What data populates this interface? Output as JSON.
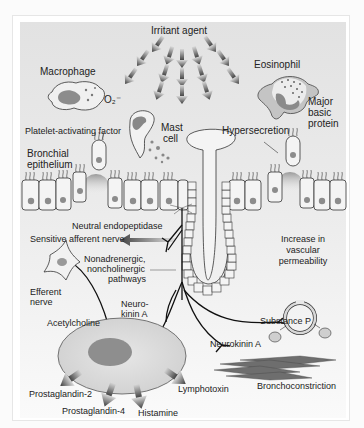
{
  "labels": {
    "irritant_agent": "Irritant agent",
    "macrophage": "Macrophage",
    "o2": "O₂⁻",
    "eosinophil": "Eosinophil",
    "major_basic_protein": "Major basic protein",
    "platelet_activating_factor": "Platelet-activating factor",
    "mast_cell_1": "Mast",
    "mast_cell_2": "cell",
    "hypersecretion": "Hypersecretion",
    "bronchial_epithelium_1": "Bronchial",
    "bronchial_epithelium_2": "epithelium",
    "neutral_endopeptidase": "Neutral endopeptidase",
    "sensitive_afferent_nerve": "Sensitive afferent nerve",
    "nanc_1": "Nonadrenergic,",
    "nanc_2": "noncholinergic",
    "nanc_3": "pathways",
    "vascular_1": "Increase in",
    "vascular_2": "vascular",
    "vascular_3": "permeability",
    "efferent_1": "Efferent",
    "efferent_2": "nerve",
    "neurokinin_a_split_1": "Neuro-",
    "neurokinin_a_split_2": "kinin A",
    "acetylcholine": "Acetylcholine",
    "substance_p": "Substance P",
    "neurokinin_a": "Neurokinin A",
    "bronchoconstriction": "Bronchoconstriction",
    "prostaglandin_2": "Prostaglandin-2",
    "prostaglandin_4": "Prostaglandin-4",
    "histamine": "Histamine",
    "lymphotoxin": "Lymphotoxin"
  },
  "colors": {
    "panel_bg": "#e6e6e6",
    "cell_fill": "#f4f4f4",
    "nucleus": "#8c8c8c",
    "outline": "#333333",
    "nerve": "#111111",
    "muscle": "#6e6e6e"
  }
}
